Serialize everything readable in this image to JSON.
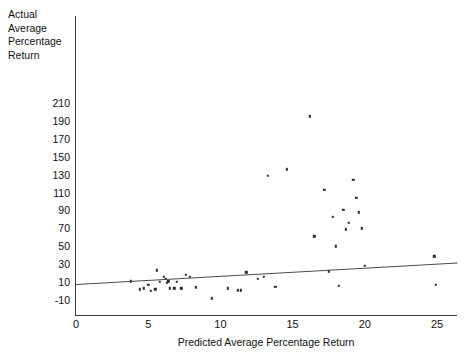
{
  "chart_data": {
    "type": "scatter",
    "title": "",
    "xlabel": "Predicted Average Percentage Return",
    "ylabel": "Actual Average Percentage Return",
    "ylabel_lines": [
      "Actual",
      "Average",
      "Percentage",
      "Return"
    ],
    "xlim": [
      0,
      26.5
    ],
    "ylim": [
      -14,
      218
    ],
    "xticks": [
      0,
      5,
      10,
      15,
      20,
      25
    ],
    "xtick_labels": [
      "0",
      "5",
      "10",
      "15",
      "20",
      "25"
    ],
    "yticks": [
      -10,
      10,
      30,
      50,
      70,
      90,
      110,
      130,
      150,
      170,
      190,
      210
    ],
    "ytick_labels": [
      "-10",
      "10",
      "30",
      "50",
      "70",
      "90",
      "110",
      "130",
      "150",
      "170",
      "190",
      "210"
    ],
    "grid": false,
    "legend": null,
    "marker": "square",
    "marker_color": "#2b2b2b",
    "points": [
      {
        "x": 3.8,
        "y": 11
      },
      {
        "x": 4.4,
        "y": 2
      },
      {
        "x": 4.7,
        "y": 3
      },
      {
        "x": 5.0,
        "y": 7
      },
      {
        "x": 5.2,
        "y": 0
      },
      {
        "x": 5.5,
        "y": 2
      },
      {
        "x": 5.6,
        "y": 23
      },
      {
        "x": 5.8,
        "y": 10
      },
      {
        "x": 6.1,
        "y": 16
      },
      {
        "x": 6.2,
        "y": 14
      },
      {
        "x": 6.3,
        "y": 9
      },
      {
        "x": 6.4,
        "y": 11
      },
      {
        "x": 6.5,
        "y": 3
      },
      {
        "x": 6.8,
        "y": 3
      },
      {
        "x": 7.0,
        "y": 10
      },
      {
        "x": 7.3,
        "y": 3
      },
      {
        "x": 7.6,
        "y": 18
      },
      {
        "x": 7.9,
        "y": 16
      },
      {
        "x": 8.3,
        "y": 4
      },
      {
        "x": 9.4,
        "y": -8
      },
      {
        "x": 10.5,
        "y": 3
      },
      {
        "x": 11.2,
        "y": 1
      },
      {
        "x": 11.4,
        "y": 1
      },
      {
        "x": 11.8,
        "y": 21
      },
      {
        "x": 12.6,
        "y": 14
      },
      {
        "x": 13.0,
        "y": 16
      },
      {
        "x": 13.3,
        "y": 129
      },
      {
        "x": 13.8,
        "y": 5
      },
      {
        "x": 14.6,
        "y": 136
      },
      {
        "x": 16.2,
        "y": 195
      },
      {
        "x": 16.5,
        "y": 61
      },
      {
        "x": 17.2,
        "y": 113
      },
      {
        "x": 17.5,
        "y": 22
      },
      {
        "x": 17.8,
        "y": 83
      },
      {
        "x": 18.0,
        "y": 50
      },
      {
        "x": 18.2,
        "y": 6
      },
      {
        "x": 18.5,
        "y": 91
      },
      {
        "x": 18.7,
        "y": 69
      },
      {
        "x": 18.9,
        "y": 76
      },
      {
        "x": 19.2,
        "y": 124
      },
      {
        "x": 19.4,
        "y": 104
      },
      {
        "x": 19.6,
        "y": 88
      },
      {
        "x": 19.8,
        "y": 70
      },
      {
        "x": 20.0,
        "y": 28
      },
      {
        "x": 24.8,
        "y": 39
      },
      {
        "x": 24.9,
        "y": 7
      }
    ],
    "trendline": {
      "label": "fitted regression line",
      "x0": 0,
      "y0": 8,
      "x1": 26.4,
      "y1": 32
    }
  }
}
